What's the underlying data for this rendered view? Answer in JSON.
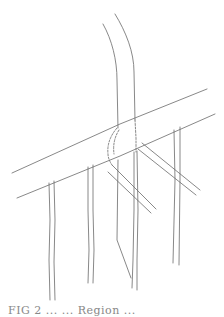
{
  "figure": {
    "caption": "FIG 2 ... ... Region ...",
    "caption_note": "caption truncated at bottom edge",
    "stroke_color": "#6a6a6a",
    "background_color": "#ffffff"
  }
}
